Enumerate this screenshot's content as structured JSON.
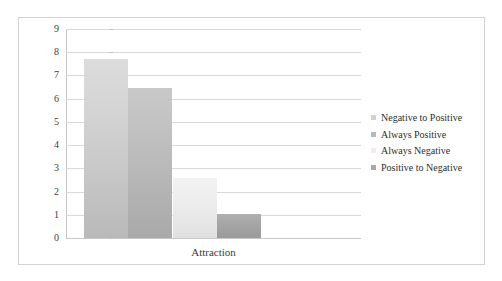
{
  "chart_data": {
    "type": "bar",
    "title": "",
    "xlabel": "Attraction",
    "ylabel": "",
    "categories": [
      "Attraction"
    ],
    "ylim": [
      0,
      9
    ],
    "ytick_labels": [
      "9",
      "8",
      "7",
      "6",
      "5",
      "4",
      "3",
      "2",
      "1",
      "0"
    ],
    "ytick_values": [
      9,
      8,
      7,
      6,
      5,
      4,
      3,
      2,
      1,
      0
    ],
    "grid": true,
    "legend_position": "right",
    "series": [
      {
        "name": "Negative to Positive",
        "values": [
          7.7
        ],
        "color": "#d2d2d2"
      },
      {
        "name": "Always Positive",
        "values": [
          6.45
        ],
        "color": "#b8b8b8"
      },
      {
        "name": "Always Negative",
        "values": [
          2.6
        ],
        "color": "#ededed"
      },
      {
        "name": "Positive to Negative",
        "values": [
          1.05
        ],
        "color": "#a8a8a8"
      }
    ]
  },
  "axis": {
    "x_title": "Attraction"
  },
  "legend": {
    "items": [
      {
        "label": "Negative to Positive"
      },
      {
        "label": "Always Positive"
      },
      {
        "label": "Always Negative"
      },
      {
        "label": "Positive to Negative"
      }
    ]
  }
}
